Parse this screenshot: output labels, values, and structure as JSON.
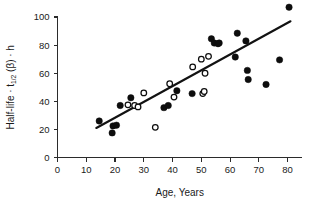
{
  "figure": {
    "background": "#ffffff",
    "ink_color": "#0d0d0d"
  },
  "chart_data": {
    "type": "scatter",
    "title": "",
    "xlabel": "Age, Years",
    "ylabel": "Half-life · t1/2 (β) · h",
    "ylabel_parts": {
      "prefix": "Half-life · t",
      "subscript": "1/2",
      "middle": " (β) · h"
    },
    "xlim": [
      0,
      85
    ],
    "ylim": [
      0,
      105
    ],
    "xticks": [
      0,
      10,
      20,
      30,
      40,
      50,
      60,
      70,
      80
    ],
    "yticks": [
      0,
      20,
      40,
      60,
      80,
      100
    ],
    "xtick_labels": [
      "0",
      "10",
      "20",
      "30",
      "40",
      "50",
      "60",
      "70",
      "80"
    ],
    "ytick_labels": [
      "0",
      "20",
      "40",
      "60",
      "80",
      "100"
    ],
    "grid": false,
    "legend": false,
    "legend_position": "none",
    "marker_radius": 3.2,
    "series": [
      {
        "name": "filled-circles",
        "marker": "filled-circle",
        "color": "#0d0d0d",
        "points": [
          [
            14.5,
            26.0
          ],
          [
            19.0,
            17.5
          ],
          [
            19.3,
            22.5
          ],
          [
            20.5,
            23.0
          ],
          [
            21.8,
            37.0
          ],
          [
            25.5,
            42.5
          ],
          [
            37.0,
            35.5
          ],
          [
            38.5,
            37.0
          ],
          [
            41.5,
            47.5
          ],
          [
            46.8,
            45.5
          ],
          [
            53.5,
            84.5
          ],
          [
            54.5,
            81.5
          ],
          [
            55.8,
            81.0
          ],
          [
            56.2,
            81.5
          ],
          [
            61.8,
            71.5
          ],
          [
            62.5,
            88.5
          ],
          [
            65.5,
            83.0
          ],
          [
            66.0,
            62.0
          ],
          [
            66.3,
            55.5
          ],
          [
            72.5,
            52.0
          ],
          [
            77.2,
            69.5
          ],
          [
            80.5,
            107.0
          ]
        ]
      },
      {
        "name": "open-circles",
        "marker": "open-circle",
        "color": "#ffffff",
        "points": [
          [
            24.5,
            37.5
          ],
          [
            26.8,
            37.0
          ],
          [
            28.0,
            36.0
          ],
          [
            30.0,
            46.0
          ],
          [
            34.0,
            21.5
          ],
          [
            39.0,
            52.5
          ],
          [
            40.5,
            43.0
          ],
          [
            47.0,
            64.5
          ],
          [
            50.0,
            70.0
          ],
          [
            50.5,
            45.5
          ],
          [
            51.0,
            47.0
          ],
          [
            51.3,
            60.0
          ],
          [
            52.5,
            72.0
          ]
        ]
      }
    ],
    "fit_line": {
      "name": "regression-line",
      "x_start": 13.5,
      "y_start": 21.0,
      "x_end": 81.0,
      "y_end": 97.0,
      "color": "#121212"
    }
  }
}
